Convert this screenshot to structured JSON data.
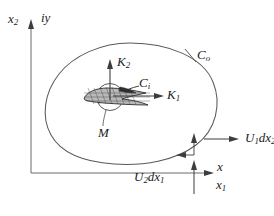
{
  "figure": {
    "stroke_color": "#4a4a4a",
    "text_color": "#1c1c1c",
    "inclusion_fill": "#b9b9b9",
    "background": "#ffffff"
  },
  "axes": {
    "vertical": {
      "label_outer": "x",
      "label_outer_sub": "2",
      "label_complex": "iy",
      "arrow": "up-arrow-icon"
    },
    "horizontal": {
      "label_real": "x",
      "label_cartesian": "x",
      "label_cartesian_sub": "1",
      "arrow": "right-arrow-icon"
    }
  },
  "contours": {
    "outer": {
      "label": "C",
      "sub": "o",
      "name": "outer-contour"
    },
    "inner": {
      "label": "C",
      "sub": "i",
      "name": "inner-contour"
    }
  },
  "inclusion": {
    "name": "hatched-inclusion",
    "moment_label": "M"
  },
  "forces": [
    {
      "id": "k2",
      "label": "K",
      "sub": "2",
      "direction": "up"
    },
    {
      "id": "k1",
      "label": "K",
      "sub": "1",
      "direction": "right"
    }
  ],
  "displacements": [
    {
      "id": "u1dx2",
      "text_main": "U",
      "sub1": "1",
      "text_mid": "dx",
      "sub2": "2",
      "direction": "right"
    },
    {
      "id": "u2dx1",
      "text_main": "U",
      "sub1": "2",
      "text_mid": "dx",
      "sub2": "1",
      "direction": "up"
    }
  ]
}
